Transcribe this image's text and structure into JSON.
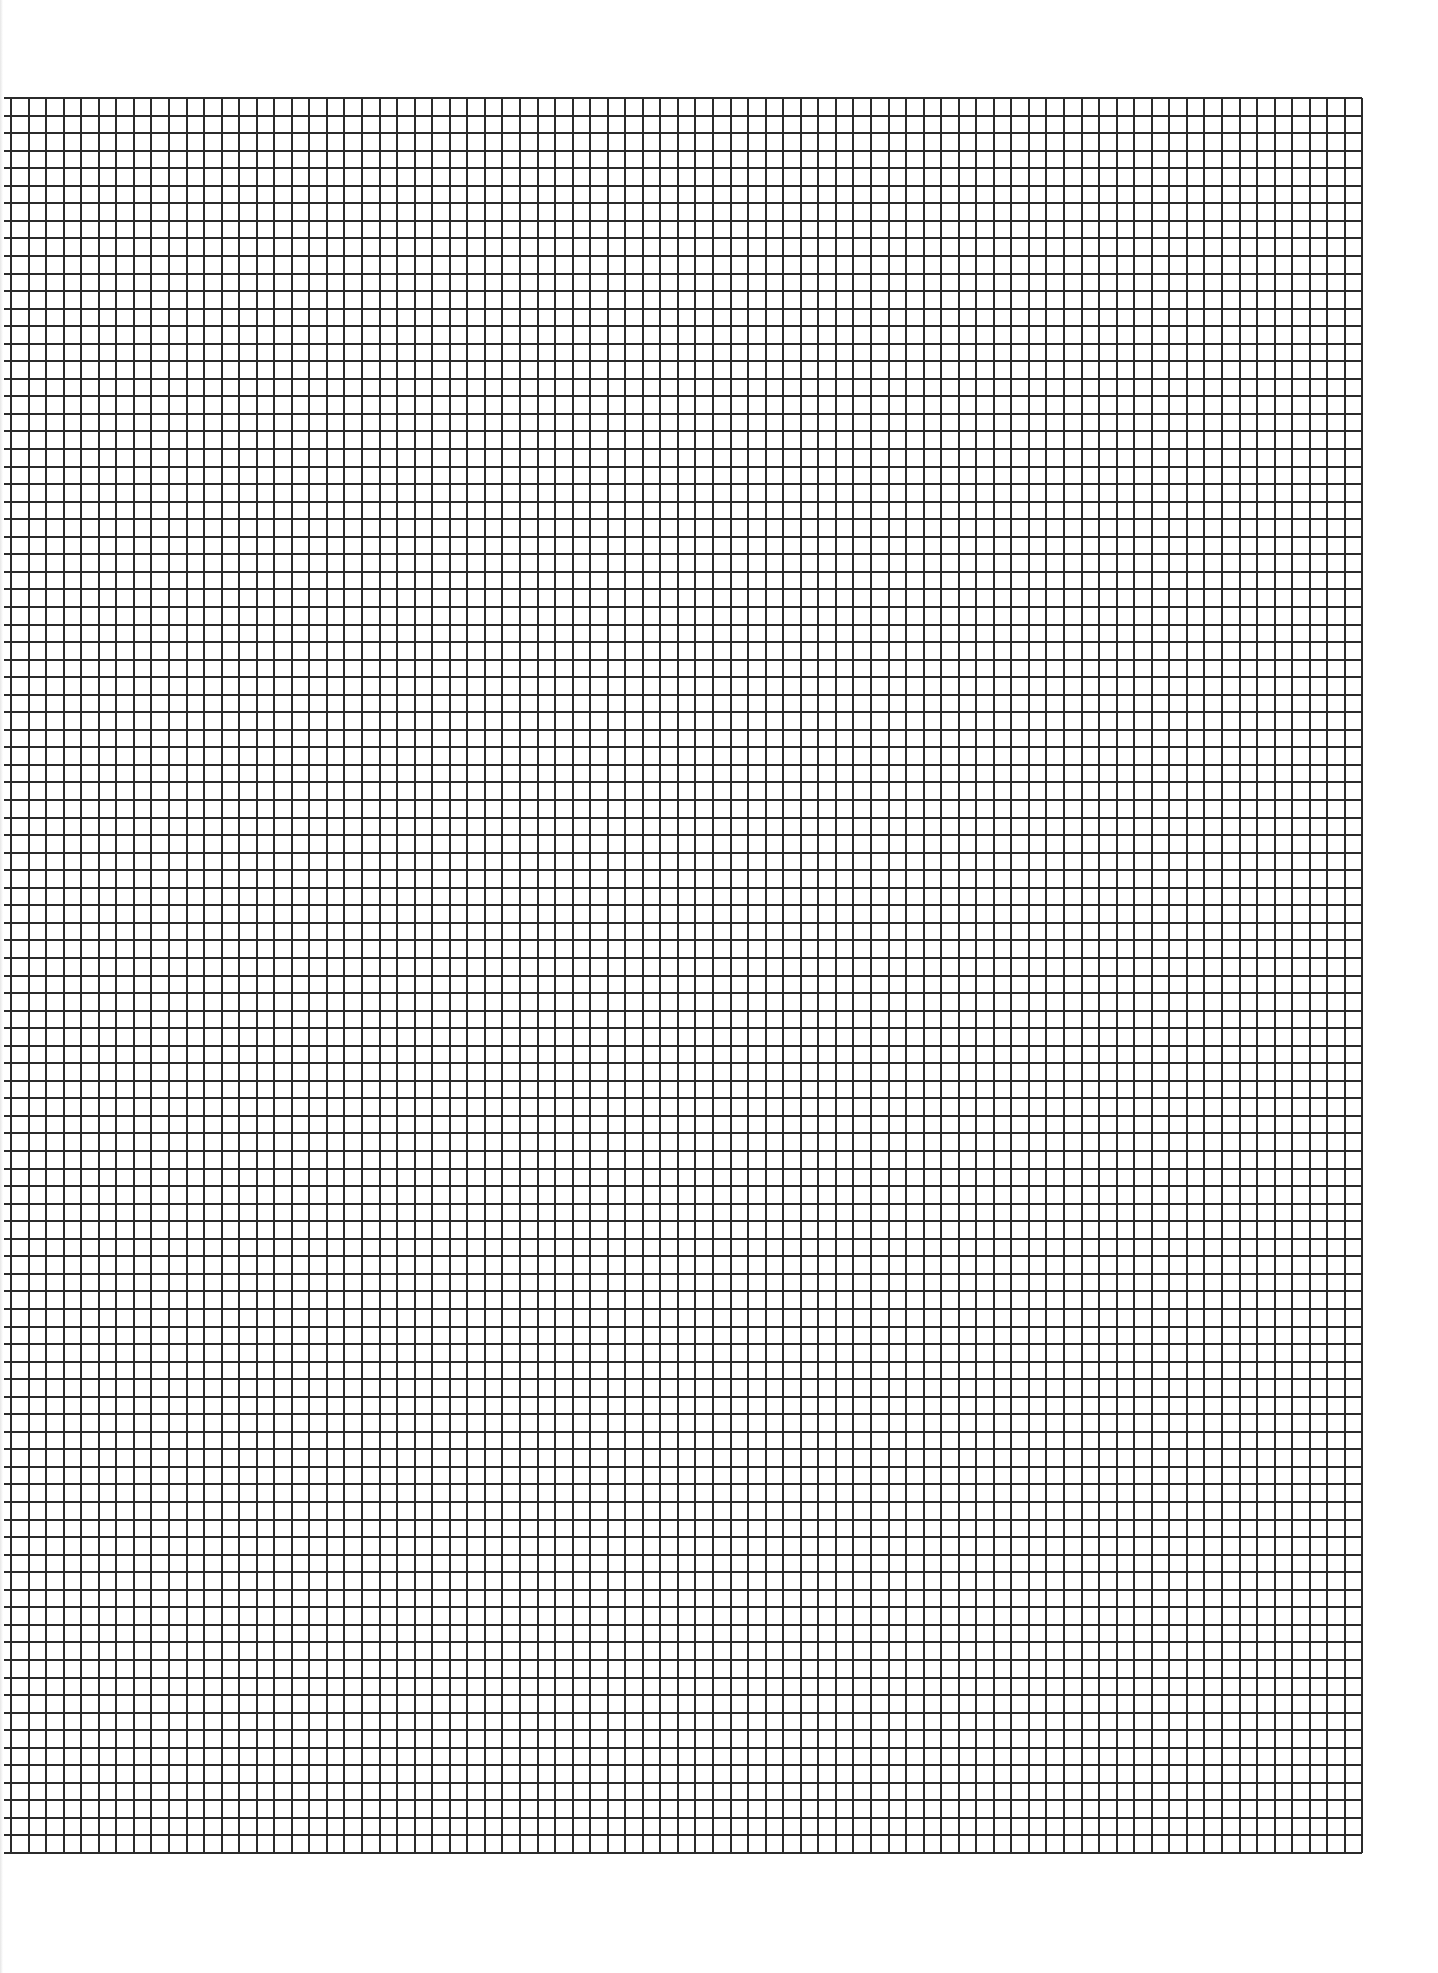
{
  "document": {
    "type": "graph-paper",
    "background_color": "#ffffff",
    "line_color": "#2b2b2b"
  },
  "grid": {
    "columns": 77,
    "rows": 100,
    "cell_size_px": 17.55,
    "origin_x": 11,
    "origin_y": 97,
    "line_width_px": 2,
    "left_overhang_px": 7,
    "line_color": "#2b2b2b"
  }
}
